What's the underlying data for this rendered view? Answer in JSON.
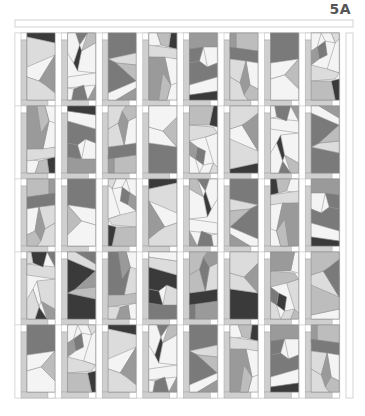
{
  "label": "5A",
  "colors": {
    "frame_line": "#c8c8c8",
    "strip": "#cfcfcf",
    "white": "#ffffff",
    "c0": "#f4f4f4",
    "c1": "#dcdcdc",
    "c2": "#bdbdbd",
    "c3": "#9a9a9a",
    "c4": "#7a7a7a",
    "c5": "#3a3a3a"
  },
  "layout": {
    "grid_x0": 15,
    "grid_y0": 33,
    "cell_w": 40.6,
    "cell_h": 73,
    "cols": 8,
    "rows": 5,
    "top_border": {
      "x": 15,
      "y": 20,
      "w": 338,
      "h": 7
    },
    "right_border": {
      "x": 346,
      "y": 33,
      "w": 7,
      "h": 365
    }
  },
  "blocks": [
    [
      [
        [
          0,
          0,
          28,
          0,
          28,
          10,
          0,
          4
        ],
        5
      ],
      [
        [
          0,
          4,
          28,
          10,
          28,
          45,
          0,
          34
        ],
        1
      ],
      [
        [
          0,
          34,
          28,
          22,
          12,
          48,
          0,
          44
        ],
        0
      ],
      [
        [
          12,
          48,
          28,
          22,
          28,
          60,
          18,
          52
        ],
        3
      ],
      [
        [
          0,
          44,
          12,
          48,
          18,
          52,
          28,
          60,
          28,
          67,
          0,
          67
        ],
        1
      ]
    ],
    [
      [
        [
          0,
          0,
          8,
          0,
          14,
          18,
          0,
          10
        ],
        2
      ],
      [
        [
          8,
          0,
          20,
          0,
          16,
          12
        ],
        4
      ],
      [
        [
          14,
          18,
          16,
          12,
          22,
          30,
          18,
          38
        ],
        5
      ],
      [
        [
          20,
          0,
          28,
          0,
          28,
          20,
          22,
          30,
          16,
          12
        ],
        0
      ],
      [
        [
          0,
          10,
          14,
          18,
          18,
          38,
          0,
          40
        ],
        0
      ],
      [
        [
          0,
          40,
          28,
          44,
          28,
          55,
          0,
          52
        ],
        0
      ],
      [
        [
          0,
          52,
          8,
          67,
          0,
          67
        ],
        3
      ],
      [
        [
          8,
          67,
          12,
          52,
          22,
          56,
          24,
          67
        ],
        4
      ],
      [
        [
          22,
          56,
          28,
          55,
          28,
          67,
          24,
          67
        ],
        0
      ]
    ],
    [
      [
        [
          0,
          0,
          28,
          0,
          28,
          20,
          0,
          26
        ],
        4
      ],
      [
        [
          0,
          26,
          28,
          20,
          28,
          32,
          8,
          30
        ],
        1
      ],
      [
        [
          0,
          26,
          8,
          30,
          28,
          48,
          0,
          60
        ],
        4
      ],
      [
        [
          8,
          30,
          28,
          32,
          28,
          48
        ],
        2
      ],
      [
        [
          0,
          60,
          28,
          48,
          28,
          55,
          8,
          67,
          0,
          67
        ],
        0
      ],
      [
        [
          8,
          67,
          28,
          55,
          28,
          67
        ],
        3
      ]
    ],
    [
      [
        [
          0,
          0,
          6,
          0,
          8,
          14,
          0,
          16
        ],
        5
      ],
      [
        [
          6,
          0,
          20,
          0,
          16,
          12,
          8,
          14
        ],
        2
      ],
      [
        [
          20,
          0,
          28,
          0,
          28,
          14,
          16,
          12
        ],
        0
      ],
      [
        [
          0,
          16,
          28,
          12,
          28,
          24,
          0,
          26
        ],
        1
      ],
      [
        [
          0,
          26,
          12,
          24,
          6,
          52,
          0,
          50
        ],
        0
      ],
      [
        [
          12,
          24,
          28,
          24,
          28,
          67,
          10,
          67,
          6,
          52
        ],
        3
      ],
      [
        [
          6,
          52,
          14,
          40,
          18,
          67,
          10,
          67
        ],
        2
      ]
    ],
    [
      [
        [
          0,
          0,
          28,
          0,
          28,
          14,
          0,
          16
        ],
        3
      ],
      [
        [
          0,
          16,
          14,
          14,
          10,
          28,
          0,
          30
        ],
        4
      ],
      [
        [
          14,
          14,
          28,
          14,
          28,
          30,
          18,
          34
        ],
        0
      ],
      [
        [
          10,
          28,
          18,
          34,
          28,
          30,
          28,
          44,
          0,
          52,
          0,
          30
        ],
        4
      ],
      [
        [
          0,
          52,
          28,
          44,
          28,
          58,
          0,
          62
        ],
        0
      ],
      [
        [
          0,
          62,
          28,
          58,
          28,
          67,
          0,
          67
        ],
        5
      ]
    ],
    [
      [
        [
          0,
          0,
          22,
          0,
          22,
          16,
          0,
          18
        ],
        2
      ],
      [
        [
          22,
          0,
          28,
          0,
          28,
          18,
          22,
          16
        ],
        3
      ],
      [
        [
          0,
          18,
          28,
          14,
          28,
          26,
          0,
          30
        ],
        4
      ],
      [
        [
          0,
          30,
          12,
          28,
          8,
          52,
          0,
          56
        ],
        0
      ],
      [
        [
          12,
          28,
          28,
          26,
          28,
          44,
          18,
          50
        ],
        1
      ],
      [
        [
          8,
          52,
          12,
          28,
          18,
          50,
          14,
          62
        ],
        3
      ],
      [
        [
          0,
          56,
          8,
          52,
          14,
          62,
          10,
          67,
          0,
          67
        ],
        2
      ],
      [
        [
          14,
          62,
          18,
          50,
          28,
          44,
          28,
          67,
          10,
          67
        ],
        1
      ]
    ],
    [
      [
        [
          0,
          0,
          28,
          0,
          28,
          26,
          0,
          30
        ],
        4
      ],
      [
        [
          0,
          30,
          28,
          26,
          14,
          42,
          0,
          46
        ],
        0
      ],
      [
        [
          14,
          42,
          28,
          26,
          28,
          56
        ],
        2
      ],
      [
        [
          0,
          46,
          14,
          42,
          28,
          56,
          28,
          67,
          0,
          67
        ],
        0
      ]
    ],
    [
      [
        [
          0,
          0,
          8,
          0,
          4,
          10,
          0,
          6
        ],
        1
      ],
      [
        [
          8,
          0,
          18,
          0,
          14,
          8,
          4,
          10
        ],
        0
      ],
      [
        [
          18,
          0,
          28,
          0,
          28,
          18,
          22,
          14
        ],
        0
      ],
      [
        [
          0,
          6,
          4,
          10,
          12,
          36,
          0,
          40
        ],
        0
      ],
      [
        [
          14,
          8,
          22,
          14,
          20,
          26,
          12,
          22
        ],
        4
      ],
      [
        [
          22,
          14,
          28,
          18,
          28,
          32,
          20,
          26
        ],
        3
      ],
      [
        [
          0,
          40,
          12,
          36,
          28,
          32,
          28,
          48,
          4,
          46
        ],
        1
      ],
      [
        [
          0,
          46,
          8,
          48,
          4,
          67,
          0,
          67
        ],
        5
      ],
      [
        [
          8,
          48,
          28,
          48,
          28,
          67,
          4,
          67
        ],
        2
      ]
    ]
  ],
  "rows_seed": [
    0,
    3,
    5,
    1,
    6
  ],
  "annotations": {
    "blocks_per_row": 8,
    "rows": 5,
    "description": "Quilt layout of pieced blocks with sashing strips and corner squares"
  }
}
